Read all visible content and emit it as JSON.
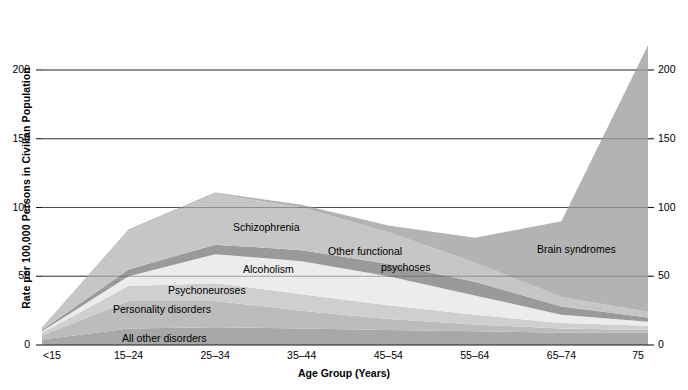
{
  "chart_data": {
    "type": "area",
    "stacked": true,
    "title": "",
    "xlabel": "Age Group (Years)",
    "ylabel": "Rate per 100,000 Persons in Civilian Population",
    "categories": [
      "<15",
      "15–24",
      "25–34",
      "35–44",
      "45–54",
      "55–64",
      "65–74",
      "75"
    ],
    "xtick_labels": [
      "<15",
      "15–24",
      "25–34",
      "35–44",
      "45–54",
      "55–64",
      "65–74",
      "75"
    ],
    "ytick_labels": [
      "0",
      "50",
      "100",
      "150",
      "200"
    ],
    "ytick_values": [
      0,
      50,
      100,
      150,
      200
    ],
    "ylim": [
      0,
      232
    ],
    "grid": true,
    "gridlines_at": [
      50,
      100,
      150,
      200
    ],
    "legend_position": "inline-labels",
    "series": [
      {
        "name": "All other disorders",
        "color": "#a8a8a8",
        "values": [
          4,
          12,
          13,
          12,
          11,
          10,
          9,
          9
        ],
        "label_x_index": 2,
        "label_y": 6
      },
      {
        "name": "Personality disorders",
        "color": "#bcbcbc",
        "values": [
          3,
          20,
          19,
          13,
          8,
          5,
          3,
          2
        ],
        "label_x_index": 1,
        "label_y": 24
      },
      {
        "name": "Psychoneuroses",
        "color": "#cfcfcf",
        "values": [
          2,
          11,
          13,
          12,
          10,
          7,
          4,
          3
        ],
        "label_x_index": 2,
        "label_y": 43
      },
      {
        "name": "Alcoholism",
        "color": "#ececec",
        "values": [
          1,
          7,
          21,
          24,
          21,
          14,
          6,
          3
        ],
        "label_x_index": 3,
        "label_y": 57
      },
      {
        "name": "Other functional psychoses",
        "color": "#9a9a9a",
        "values": [
          1,
          5,
          7,
          8,
          9,
          10,
          6,
          3
        ],
        "label_x_index": 4,
        "label_y": 67
      },
      {
        "name": "Schizophrenia",
        "color": "#c6c6c6",
        "values": [
          2,
          28,
          37,
          31,
          23,
          14,
          7,
          4
        ],
        "label_x_index": 3,
        "label_y": 88
      },
      {
        "name": "Brain syndromes",
        "color": "#b3b3b3",
        "values": [
          0,
          1,
          1,
          2,
          5,
          18,
          55,
          194
        ],
        "label_x_index": 6,
        "label_y": 73
      }
    ],
    "stack_tops": [
      13,
      84,
      111,
      102,
      87,
      78,
      90,
      218
    ],
    "annotations": [
      {
        "text": "Schizophrenia",
        "x_px": 233,
        "y_px": 221
      },
      {
        "text": "Alcoholism",
        "x_px": 243,
        "y_px": 263
      },
      {
        "text": "Other functional",
        "x_px": 328,
        "y_px": 245
      },
      {
        "text": "psychoses",
        "x_px": 381,
        "y_px": 261
      },
      {
        "text": "Psychoneuroses",
        "x_px": 168,
        "y_px": 284
      },
      {
        "text": "Personality disorders",
        "x_px": 113,
        "y_px": 303
      },
      {
        "text": "All other disorders",
        "x_px": 122,
        "y_px": 332
      },
      {
        "text": "Brain syndromes",
        "x_px": 537,
        "y_px": 243
      }
    ]
  },
  "axes": {
    "y_title": "Rate per 100,000 Persons in Civilian Population",
    "x_title": "Age Group (Years)"
  }
}
